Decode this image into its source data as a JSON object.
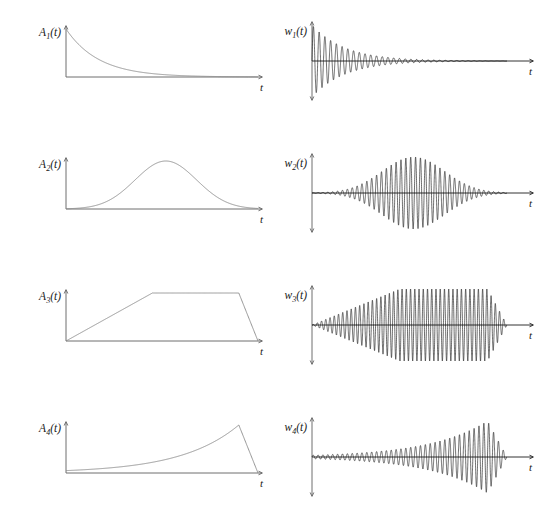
{
  "figure": {
    "title": "",
    "rows": 4,
    "columns": 2,
    "background": "#ffffff",
    "envelope_color": "#8a8a8a",
    "wave_color": "#121212",
    "axis_color": "#6e6e6e"
  },
  "labels": {
    "t_axis": "t",
    "row1_envelope": "A",
    "row1_envelope_sub": "1",
    "row1_envelope_arg": "(t)",
    "row2_envelope": "A",
    "row2_envelope_sub": "2",
    "row2_envelope_arg": "(t)",
    "row3_envelope": "A",
    "row3_envelope_sub": "3",
    "row3_envelope_arg": "(t)",
    "row4_envelope": "A",
    "row4_envelope_sub": "4",
    "row4_envelope_arg": "(t)",
    "row1_wave": "w",
    "row1_wave_sub": "1",
    "row1_wave_arg": "(t)",
    "row2_wave": "w",
    "row2_wave_sub": "2",
    "row2_wave_arg": "(t)",
    "row3_wave": "w",
    "row3_wave_sub": "3",
    "row3_wave_arg": "(t)",
    "row4_wave": "w",
    "row4_wave_sub": "4",
    "row4_wave_arg": "(t)"
  },
  "chart_data": {
    "type": "line",
    "title": "",
    "xlabel": "t",
    "ylabel": "",
    "grid": false,
    "legend": "none",
    "panels": [
      {
        "id": "A1",
        "row": 1,
        "column": "left",
        "label": "A1(t)",
        "xlabel": "t",
        "kind": "envelope",
        "shape": "decaying-exponential",
        "formula": "A1(t) = exp(-t/tau), tau = 0.17",
        "xlim": [
          0,
          1
        ],
        "ylim": [
          0,
          1
        ],
        "x": [
          0.0,
          0.05,
          0.1,
          0.15,
          0.2,
          0.25,
          0.3,
          0.35,
          0.4,
          0.5,
          0.6,
          0.7,
          0.8,
          0.9,
          1.0
        ],
        "y": [
          1.0,
          0.746,
          0.556,
          0.415,
          0.309,
          0.231,
          0.172,
          0.128,
          0.096,
          0.053,
          0.03,
          0.016,
          0.009,
          0.005,
          0.003
        ]
      },
      {
        "id": "w1",
        "row": 1,
        "column": "right",
        "label": "w1(t)",
        "xlabel": "t",
        "kind": "waveform",
        "shape": "damped-oscillation",
        "formula": "w1(t) = A1(t) * sin(2*pi*f*t), f = 34",
        "carrier_cycles": 34,
        "xlim": [
          0,
          1
        ],
        "ylim": [
          -1,
          1
        ]
      },
      {
        "id": "A2",
        "row": 2,
        "column": "left",
        "label": "A2(t)",
        "xlabel": "t",
        "kind": "envelope",
        "shape": "gaussian",
        "formula": "A2(t) = exp(-((t-0.52)^2)/(2*0.16^2))",
        "peak_position": 0.52,
        "sigma": 0.16,
        "xlim": [
          0,
          1
        ],
        "ylim": [
          0,
          1
        ],
        "x": [
          0.0,
          0.1,
          0.2,
          0.3,
          0.4,
          0.45,
          0.52,
          0.6,
          0.7,
          0.8,
          0.9,
          1.0
        ],
        "y": [
          0.018,
          0.062,
          0.17,
          0.372,
          0.716,
          0.885,
          1.0,
          0.903,
          0.57,
          0.266,
          0.09,
          0.022
        ]
      },
      {
        "id": "w2",
        "row": 2,
        "column": "right",
        "label": "w2(t)",
        "xlabel": "t",
        "kind": "waveform",
        "shape": "gaussian-wave-packet",
        "formula": "w2(t) = A2(t) * sin(2*pi*f*t), f = 40",
        "carrier_cycles": 40,
        "xlim": [
          0,
          1
        ],
        "ylim": [
          -1,
          1
        ]
      },
      {
        "id": "A3",
        "row": 3,
        "column": "left",
        "label": "A3(t)",
        "xlabel": "t",
        "kind": "envelope",
        "shape": "trapezoid",
        "formula": "A3(t) = trapezoid with linear rise 0->0.45 and fall 0.90->1.00",
        "rise_end": 0.45,
        "fall_start": 0.9,
        "xlim": [
          0,
          1
        ],
        "ylim": [
          0,
          1
        ],
        "x": [
          0.0,
          0.45,
          0.9,
          1.0
        ],
        "y": [
          0.0,
          1.0,
          1.0,
          0.0
        ]
      },
      {
        "id": "w3",
        "row": 3,
        "column": "right",
        "label": "w3(t)",
        "xlabel": "t",
        "kind": "waveform",
        "shape": "trapezoid-modulated-oscillation",
        "formula": "w3(t) = A3(t) * sin(2*pi*f*t), f = 46",
        "carrier_cycles": 46,
        "xlim": [
          0,
          1
        ],
        "ylim": [
          -1,
          1
        ]
      },
      {
        "id": "A4",
        "row": 4,
        "column": "left",
        "label": "A4(t)",
        "xlabel": "t",
        "kind": "envelope",
        "shape": "rising-exponential-with-abrupt-cutoff",
        "formula": "A4(t) = exp((t-0.90)/0.30) for t<0.90, then linear drop to 0 at t=1",
        "peak_position": 0.9,
        "xlim": [
          0,
          1
        ],
        "ylim": [
          0,
          1
        ],
        "x": [
          0.0,
          0.2,
          0.4,
          0.55,
          0.7,
          0.8,
          0.86,
          0.9,
          1.0
        ],
        "y": [
          0.05,
          0.096,
          0.189,
          0.308,
          0.513,
          0.717,
          0.861,
          1.0,
          0.0
        ]
      },
      {
        "id": "w4",
        "row": 4,
        "column": "right",
        "label": "w4(t)",
        "xlabel": "t",
        "kind": "waveform",
        "shape": "growing-oscillation-with-abrupt-cutoff",
        "formula": "w4(t) = A4(t) * sin(2*pi*f*t), f = 40",
        "carrier_cycles": 40,
        "xlim": [
          0,
          1
        ],
        "ylim": [
          -1,
          1
        ]
      }
    ]
  }
}
